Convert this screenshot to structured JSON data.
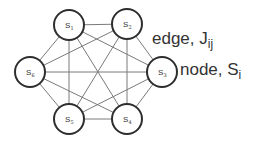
{
  "diagram": {
    "type": "complete-graph",
    "nodes": [
      {
        "id": "S1",
        "symbol": "S",
        "subscript": "1"
      },
      {
        "id": "S2",
        "symbol": "S",
        "subscript": "2"
      },
      {
        "id": "S3",
        "symbol": "S",
        "subscript": "3"
      },
      {
        "id": "S4",
        "symbol": "S",
        "subscript": "4"
      },
      {
        "id": "S5",
        "symbol": "S",
        "subscript": "5"
      },
      {
        "id": "S6",
        "symbol": "S",
        "subscript": "6"
      }
    ],
    "edges": [
      [
        "S1",
        "S2"
      ],
      [
        "S1",
        "S3"
      ],
      [
        "S1",
        "S4"
      ],
      [
        "S1",
        "S5"
      ],
      [
        "S1",
        "S6"
      ],
      [
        "S2",
        "S3"
      ],
      [
        "S2",
        "S4"
      ],
      [
        "S2",
        "S5"
      ],
      [
        "S2",
        "S6"
      ],
      [
        "S3",
        "S4"
      ],
      [
        "S3",
        "S5"
      ],
      [
        "S3",
        "S6"
      ],
      [
        "S4",
        "S5"
      ],
      [
        "S4",
        "S6"
      ],
      [
        "S5",
        "S6"
      ]
    ],
    "annotations": {
      "edge": {
        "text": "edge, J",
        "subscript": "ij"
      },
      "node": {
        "text": "node, S",
        "subscript": "i"
      }
    },
    "colors": {
      "edge": "#7a7a7a",
      "node_stroke": "#2e2e2e",
      "text": "#333333"
    }
  }
}
